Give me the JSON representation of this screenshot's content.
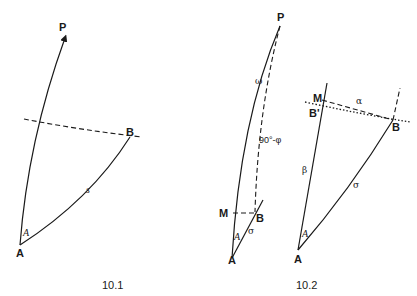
{
  "figures": [
    {
      "caption": "10.1",
      "labels": {
        "pole": "P",
        "point_a": "A",
        "point_b": "B",
        "angle_a": "A",
        "arc": "s"
      }
    },
    {
      "caption": "10.2",
      "left": {
        "pole": "P",
        "omega": "ω",
        "colatitude": "90°-φ",
        "point_m": "M",
        "point_b": "B",
        "angle_a": "A",
        "sigma": "σ",
        "point_a": "A"
      },
      "right": {
        "point_m": "M",
        "point_b_prime": "B'",
        "alpha": "α",
        "point_b": "B",
        "beta": "β",
        "sigma": "σ",
        "angle_a": "A",
        "point_a": "A"
      }
    }
  ],
  "colors": {
    "ink": "#1a1a1a",
    "background": "#ffffff"
  }
}
